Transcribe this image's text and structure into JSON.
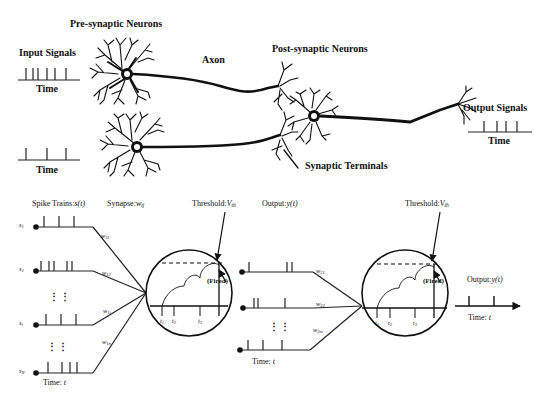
{
  "top": {
    "pre_synaptic_label": "Pre-synaptic Neurons",
    "post_synaptic_label": "Post-synaptic Neurons",
    "axon_label": "Axon",
    "synaptic_terminals_label": "Synaptic Terminals",
    "input_signals_label": "Input Signals",
    "output_signals_label": "Output Signals",
    "time_label": "Time",
    "input_train_1_spikes": 6,
    "input_train_2_spikes": 3,
    "output_train_spikes": 4
  },
  "bottom": {
    "spike_trains_label": "Spike Trains:",
    "spike_trains_var": "s(t)",
    "synapse_label": "Synapse:",
    "synapse_var": "w",
    "synapse_sub": "ij",
    "threshold_label": "Threshold:",
    "threshold_var": "V",
    "threshold_sub": "th",
    "output_label": "Output:",
    "output_var": "y(t)",
    "fired_label": "(Fired)",
    "time_label": "Time:",
    "time_var": "t",
    "inputs": [
      {
        "name": "s",
        "sub": "1",
        "weight": "w",
        "weight_sub": "11"
      },
      {
        "name": "s",
        "sub": "2",
        "weight": "w",
        "weight_sub": "12"
      },
      {
        "name": "s",
        "sub": "i",
        "weight": "w",
        "weight_sub": "1i"
      },
      {
        "name": "s",
        "sub": "N",
        "weight": "w",
        "weight_sub": "1n"
      }
    ],
    "layer2_weights": [
      {
        "weight": "w",
        "weight_sub": "21"
      },
      {
        "weight": "w",
        "weight_sub": "22"
      },
      {
        "weight": "w",
        "weight_sub": "2m"
      }
    ],
    "spike_times": [
      {
        "t": "t",
        "sub": "1"
      },
      {
        "t": "t",
        "sub": "2"
      },
      {
        "t": "t",
        "sub": "3"
      }
    ],
    "ellipsis": "⋮ ⋮"
  }
}
